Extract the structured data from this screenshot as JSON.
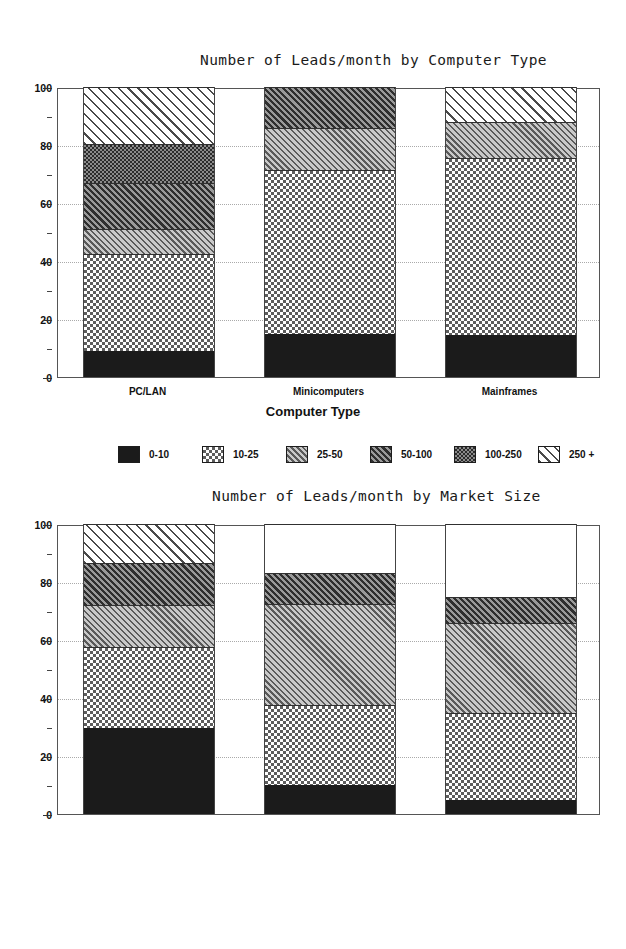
{
  "chart_data": [
    {
      "type": "bar",
      "stacked": true,
      "title": "Number of Leads/month by Computer Type",
      "xlabel": "Computer Type",
      "ylabel": "",
      "ylim": [
        0,
        100
      ],
      "yticks": [
        0,
        20,
        40,
        60,
        80,
        100
      ],
      "yminor": [
        10,
        30,
        50,
        70,
        90
      ],
      "grid": true,
      "legend_position": "below",
      "categories": [
        "PC/LAN",
        "Minicomputers",
        "Mainframes"
      ],
      "series": [
        {
          "name": "0-10",
          "pattern": "solid",
          "values": [
            9,
            15,
            14.5
          ]
        },
        {
          "name": "10-25",
          "pattern": "check-light",
          "values": [
            33.5,
            56.5,
            61
          ]
        },
        {
          "name": "25-50",
          "pattern": "diag-mid",
          "values": [
            8.5,
            14.5,
            12.5
          ]
        },
        {
          "name": "50-100",
          "pattern": "diag-dark",
          "values": [
            16,
            14,
            0
          ]
        },
        {
          "name": "100-250",
          "pattern": "check-dark",
          "values": [
            13.5,
            0,
            0
          ]
        },
        {
          "name": "250 +",
          "pattern": "diag-light",
          "values": [
            19.5,
            0,
            12
          ]
        }
      ],
      "cumulative": [
        [
          9,
          42.5,
          51,
          67,
          80.5,
          100
        ],
        [
          15,
          71.5,
          86,
          100,
          100,
          100
        ],
        [
          14.5,
          75.5,
          88,
          88,
          88,
          100
        ]
      ]
    },
    {
      "type": "bar",
      "stacked": true,
      "title": "Number of Leads/month by Market Size",
      "xlabel": "",
      "ylabel": "",
      "ylim": [
        0,
        100
      ],
      "yticks": [
        0,
        20,
        40,
        60,
        80,
        100
      ],
      "yminor": [
        10,
        30,
        50,
        70,
        90
      ],
      "grid": true,
      "legend_position": "below",
      "categories": [
        "less than 1,000",
        "1,000-10,000",
        "more than 10,000"
      ],
      "series": [
        {
          "name": "0-10",
          "pattern": "solid",
          "values": [
            29.5,
            10,
            5
          ]
        },
        {
          "name": "10-25",
          "pattern": "check-light",
          "values": [
            28,
            27.5,
            30
          ]
        },
        {
          "name": "25-50",
          "pattern": "diag-mid",
          "values": [
            14.5,
            35,
            31
          ]
        },
        {
          "name": "50-100",
          "pattern": "diag-dark",
          "values": [
            14.5,
            10.5,
            9
          ]
        },
        {
          "name": "100-250",
          "pattern": "diag-light",
          "values": [
            13.5,
            0,
            0
          ]
        },
        {
          "name": "250 +",
          "pattern": "white",
          "values": [
            0,
            17,
            25
          ]
        }
      ],
      "cumulative": [
        [
          29.5,
          57.5,
          72,
          86.5,
          100,
          100
        ],
        [
          10,
          37.5,
          72.5,
          83,
          83,
          100
        ],
        [
          5,
          35,
          66,
          75,
          75,
          100
        ]
      ]
    }
  ],
  "chart1": {
    "title": "Number of Leads/month by Computer Type",
    "xaxis_title": "Computer Type",
    "yticks": [
      "0",
      "20",
      "40",
      "60",
      "80",
      "100"
    ],
    "categories": [
      "PC/LAN",
      "Minicomputers",
      "Mainframes"
    ],
    "legend": [
      {
        "label": "0-10",
        "pattern": "p-solid"
      },
      {
        "label": "10-25",
        "pattern": "p-check-light"
      },
      {
        "label": "25-50",
        "pattern": "p-diag-mid"
      },
      {
        "label": "50-100",
        "pattern": "p-diag-dark"
      },
      {
        "label": "100-250",
        "pattern": "p-check-dark"
      },
      {
        "label": "250 +",
        "pattern": "p-diag-light"
      }
    ]
  },
  "chart2": {
    "title": "Number of Leads/month by Market Size",
    "xaxis_title": "",
    "yticks": [
      "0",
      "20",
      "40",
      "60",
      "80",
      "100"
    ],
    "categories": [
      "less than 1,000",
      "1,000-10,000",
      "more than 10,000"
    ],
    "legend": [
      {
        "label": "0-10",
        "pattern": "p-solid"
      },
      {
        "label": "10-25",
        "pattern": "p-check-light"
      },
      {
        "label": "25-50",
        "pattern": "p-diag-mid"
      },
      {
        "label": "50-100",
        "pattern": "p-diag-dark"
      },
      {
        "label": "100-250",
        "pattern": "p-diag-light"
      },
      {
        "label": "250 +",
        "pattern": "p-white"
      }
    ],
    "footnote": "Legend numbers indicate market size, i.e., the number of prospects"
  }
}
